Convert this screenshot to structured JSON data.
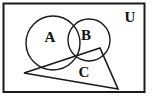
{
  "figure": {
    "type": "venn-set-diagram",
    "title": "",
    "stroke_color": "#1a1a1a",
    "fill_color": "none",
    "background_color": "#ffffff",
    "canvas": {
      "width": 157,
      "height": 99
    }
  },
  "universe": {
    "label": "U",
    "label_x": 130,
    "label_y": 22,
    "font_size": 15,
    "rect": {
      "x": 3.5,
      "y": 3.5,
      "width": 141,
      "height": 88.5
    },
    "stroke_width": 2
  },
  "sets": [
    {
      "name": "A",
      "shape": "circle",
      "label": "A",
      "label_x": 50,
      "label_y": 42,
      "font_size": 15,
      "cx": 53,
      "cy": 43,
      "r": 27,
      "stroke_width": 1.4
    },
    {
      "name": "B",
      "shape": "circle",
      "label": "B",
      "label_x": 86,
      "label_y": 40,
      "font_size": 15,
      "cx": 89,
      "cy": 40,
      "r": 21,
      "stroke_width": 1.4
    },
    {
      "name": "C",
      "shape": "triangle",
      "label": "C",
      "label_x": 84,
      "label_y": 77,
      "font_size": 15,
      "points": "24,73 100,48 118,89",
      "stroke_width": 1.6
    }
  ],
  "relations": {
    "a_intersect_b": true,
    "c_intersects_a": true,
    "c_intersects_b": true,
    "all_inside_universe": true
  }
}
